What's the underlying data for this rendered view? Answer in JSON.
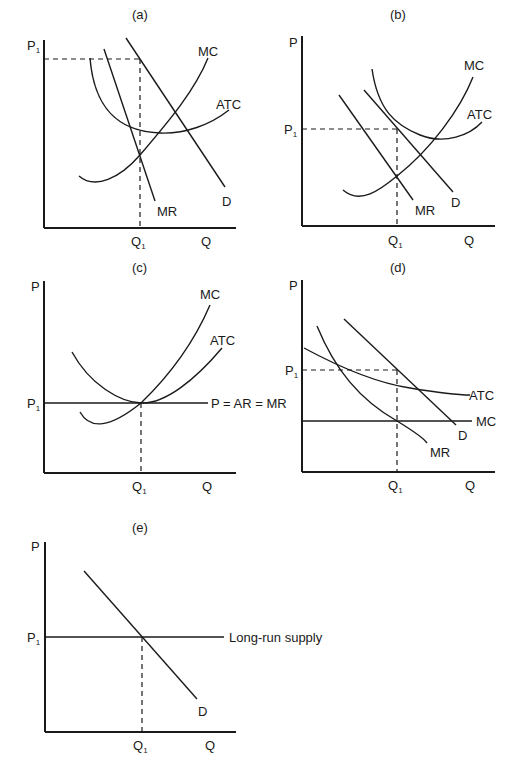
{
  "figure": {
    "panels": [
      {
        "id": "a",
        "title": "(a)",
        "y_axis_label": "P₁",
        "x_axis_label": "Q",
        "q_marker": "Q₁",
        "curves": [
          "MC",
          "ATC",
          "MR",
          "D"
        ]
      },
      {
        "id": "b",
        "title": "(b)",
        "y_axis_label": "P",
        "price_marker": "P₁",
        "x_axis_label": "Q",
        "q_marker": "Q₁",
        "curves": [
          "MC",
          "ATC",
          "MR",
          "D"
        ]
      },
      {
        "id": "c",
        "title": "(c)",
        "y_axis_label": "P",
        "price_marker": "P₁",
        "x_axis_label": "Q",
        "q_marker": "Q₁",
        "curves": [
          "MC",
          "ATC",
          "P = AR = MR"
        ]
      },
      {
        "id": "d",
        "title": "(d)",
        "y_axis_label": "P",
        "price_marker": "P₁",
        "x_axis_label": "Q",
        "q_marker": "Q₁",
        "curves": [
          "ATC",
          "MC",
          "D",
          "MR"
        ]
      },
      {
        "id": "e",
        "title": "(e)",
        "y_axis_label": "P",
        "price_marker": "P₁",
        "x_axis_label": "Q",
        "q_marker": "Q₁",
        "curves": [
          "Long-run supply",
          "D"
        ]
      }
    ]
  },
  "labels": {
    "a": {
      "title": "(a)",
      "p": "P",
      "p1_sub": "1",
      "q": "Q",
      "q1": "Q",
      "q1_sub": "1",
      "mc": "MC",
      "atc": "ATC",
      "mr": "MR",
      "d": "D"
    },
    "b": {
      "title": "(b)",
      "p": "P",
      "p1": "P",
      "p1_sub": "1",
      "q": "Q",
      "q1": "Q",
      "q1_sub": "1",
      "mc": "MC",
      "atc": "ATC",
      "mr": "MR",
      "d": "D"
    },
    "c": {
      "title": "(c)",
      "p": "P",
      "p1": "P",
      "p1_sub": "1",
      "q": "Q",
      "q1": "Q",
      "q1_sub": "1",
      "mc": "MC",
      "atc": "ATC",
      "price_line": "P = AR = MR"
    },
    "d": {
      "title": "(d)",
      "p": "P",
      "p1": "P",
      "p1_sub": "1",
      "q": "Q",
      "q1": "Q",
      "q1_sub": "1",
      "mc": "MC",
      "atc": "ATC",
      "mr": "MR",
      "d": "D"
    },
    "e": {
      "title": "(e)",
      "p": "P",
      "p1": "P",
      "p1_sub": "1",
      "q": "Q",
      "q1": "Q",
      "q1_sub": "1",
      "supply": "Long-run supply",
      "d": "D"
    }
  }
}
